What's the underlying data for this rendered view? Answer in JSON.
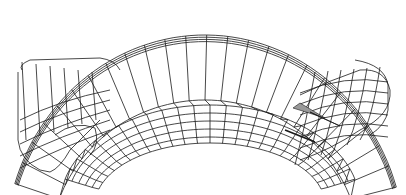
{
  "figure": {
    "width": 406,
    "height": 195,
    "background": "#ffffff",
    "stroke_color": "#1a1a1a",
    "shade_color": "#9a9a9a"
  },
  "mesh": {
    "outer_top_arc": {
      "cx": 205,
      "cy": 250,
      "rx": 200,
      "ry": 215,
      "start_deg": 198,
      "end_deg": 343
    },
    "inner_top_arc": {
      "cx": 205,
      "cy": 250,
      "rx": 155,
      "ry": 150,
      "start_deg": 200,
      "end_deg": 340
    },
    "floor_arcs": [
      {
        "cx": 210,
        "cy": 205,
        "rx": 150,
        "ry": 100
      },
      {
        "cx": 210,
        "cy": 205,
        "rx": 143,
        "ry": 92
      },
      {
        "cx": 210,
        "cy": 205,
        "rx": 136,
        "ry": 84
      },
      {
        "cx": 210,
        "cy": 205,
        "rx": 129,
        "ry": 76
      },
      {
        "cx": 210,
        "cy": 205,
        "rx": 122,
        "ry": 68
      },
      {
        "cx": 210,
        "cy": 205,
        "rx": 115,
        "ry": 62
      }
    ],
    "radial_count": 24,
    "left_end": {
      "outline": "M22,70 Q18,65 30,60 L100,58 Q115,60 120,70",
      "cross_section": "M18,72 L18,140 Q20,160 40,170 L50,172 Q60,168 70,150 L100,120"
    },
    "right_end": {
      "outline": "M355,60 Q385,65 388,85 L388,110 Q386,125 370,135",
      "cross_section": "M300,95 Q330,80 360,70 Q385,68 390,90 Q392,115 360,130 Q330,150 300,160"
    }
  }
}
